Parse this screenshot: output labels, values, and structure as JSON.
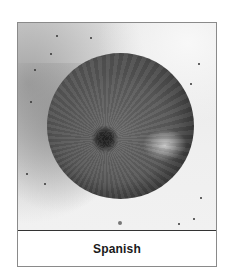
{
  "figure": {
    "caption": "Spanish",
    "image_subject": "onion-photo",
    "colors": {
      "border": "#8a8a8a",
      "divider": "#333333",
      "caption_text": "#1a1a1a",
      "background": "#ffffff"
    }
  }
}
